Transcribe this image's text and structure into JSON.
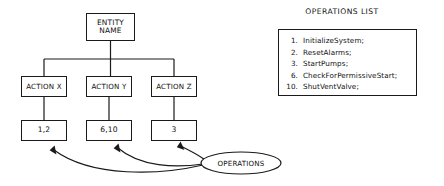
{
  "diagram": {
    "entity": {
      "line1": "ENTITY",
      "line2": "NAME"
    },
    "actions": [
      {
        "label": "ACTION X",
        "value": "1,2"
      },
      {
        "label": "ACTION Y",
        "value": "6,10"
      },
      {
        "label": "ACTION Z",
        "value": "3"
      }
    ],
    "bubble": {
      "label": "OPERATIONS"
    },
    "colors": {
      "stroke": "#1a1a1a",
      "text": "#111111",
      "background": "#ffffff"
    }
  },
  "panel": {
    "title": "OPERATIONS LIST",
    "items": [
      {
        "num": "1.",
        "name": "InitializeSystem;"
      },
      {
        "num": "2.",
        "name": "ResetAlarms;"
      },
      {
        "num": "3.",
        "name": "StartPumps;"
      },
      {
        "num": "6.",
        "name": "CheckForPermissiveStart;"
      },
      {
        "num": "10.",
        "name": "ShutVentValve;"
      }
    ]
  }
}
